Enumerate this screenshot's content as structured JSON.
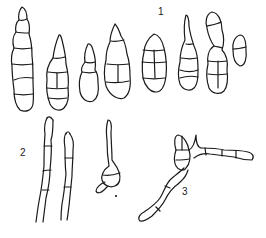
{
  "figure": {
    "labels": [
      {
        "id": "1",
        "text": "1"
      },
      {
        "id": "2",
        "text": "2"
      },
      {
        "id": "3",
        "text": "3"
      }
    ],
    "groups": [
      {
        "label": "1",
        "description": "eight multicellular spores (conidia) of varying shapes"
      },
      {
        "label": "2",
        "description": "spores with elongated germ tubes"
      },
      {
        "label": "3",
        "description": "germinating spore with branching hyphae"
      }
    ]
  }
}
